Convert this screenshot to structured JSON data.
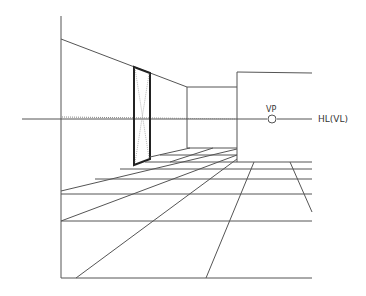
{
  "diagram": {
    "colors": {
      "line": "#555555",
      "door": "#222222",
      "guide": "#888888",
      "background": "#ffffff"
    },
    "labels": {
      "vanishing_point": "VP",
      "horizon_line": "HL(VL)"
    },
    "vanishing_point": {
      "x": 272,
      "y": 119
    },
    "horizon_line": {
      "x1": 22,
      "x2": 312,
      "y": 119
    }
  }
}
